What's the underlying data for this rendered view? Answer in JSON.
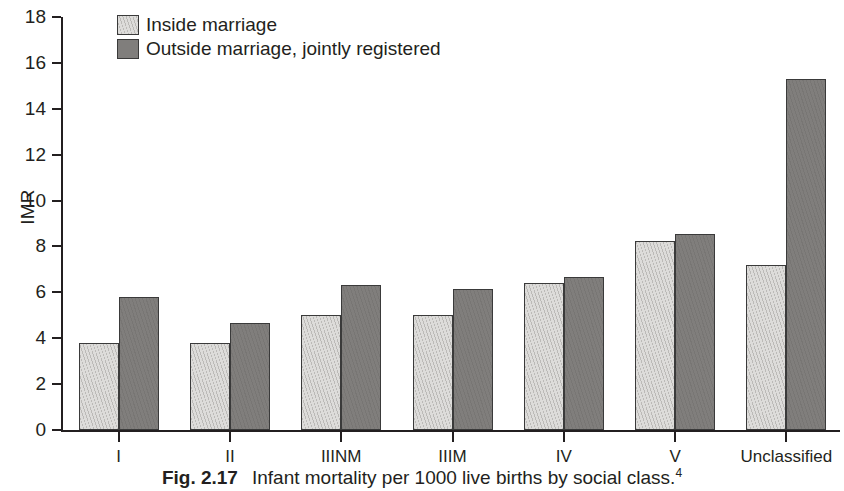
{
  "chart_data": {
    "type": "bar",
    "title": "",
    "xlabel": "",
    "ylabel": "IMR",
    "ylim": [
      0,
      18
    ],
    "ytick_step": 2,
    "yticks": [
      0,
      2,
      4,
      6,
      8,
      10,
      12,
      14,
      16,
      18
    ],
    "grid": false,
    "legend_position": "top-left",
    "categories": [
      "I",
      "II",
      "IIINM",
      "IIIM",
      "IV",
      "V",
      "Unclassified"
    ],
    "series": [
      {
        "name": "Inside marriage",
        "color": "#dddcda",
        "values": [
          3.8,
          3.8,
          5.0,
          5.0,
          6.4,
          8.25,
          7.2
        ]
      },
      {
        "name": "Outside marriage, jointly registered",
        "color": "#807e7c",
        "values": [
          5.8,
          4.65,
          6.3,
          6.15,
          6.65,
          8.55,
          15.3
        ]
      }
    ]
  },
  "caption": {
    "figure_number": "Fig. 2.17",
    "text": "Infant mortality per 1000 live births by social class.",
    "reference": "4"
  }
}
